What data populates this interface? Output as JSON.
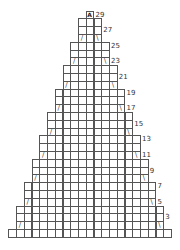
{
  "chart_title": "",
  "grid": {
    "cell_w": 7.75,
    "cell_h": 7.8,
    "origin_x": 8.3,
    "bottom_y": 229,
    "columns": 21,
    "rows": 29,
    "line_color": "#555555"
  },
  "row_labels": [
    "3",
    "5",
    "7",
    "9",
    "11",
    "13",
    "15",
    "17",
    "19",
    "21",
    "23",
    "25",
    "27",
    "29"
  ],
  "top_symbol": "A",
  "left_mark": "/",
  "right_mark": "\\",
  "bands": [
    {
      "rows": [
        1,
        1
      ],
      "cols": [
        0,
        20
      ]
    },
    {
      "rows": [
        2,
        4
      ],
      "cols": [
        1,
        19
      ],
      "mark_row": 2
    },
    {
      "rows": [
        5,
        7
      ],
      "cols": [
        2,
        18
      ],
      "mark_row": 5
    },
    {
      "rows": [
        8,
        10
      ],
      "cols": [
        3,
        17
      ],
      "mark_row": 8
    },
    {
      "rows": [
        11,
        13
      ],
      "cols": [
        4,
        16
      ],
      "mark_row": 11
    },
    {
      "rows": [
        14,
        16
      ],
      "cols": [
        5,
        15
      ],
      "mark_row": 14
    },
    {
      "rows": [
        17,
        19
      ],
      "cols": [
        6,
        14
      ],
      "mark_row": 17
    },
    {
      "rows": [
        20,
        22
      ],
      "cols": [
        7,
        13
      ],
      "mark_row": 20
    },
    {
      "rows": [
        23,
        25
      ],
      "cols": [
        8,
        12
      ],
      "mark_row": 23
    },
    {
      "rows": [
        26,
        28
      ],
      "cols": [
        9,
        11
      ],
      "mark_row": 26
    },
    {
      "rows": [
        29,
        29
      ],
      "cols": [
        10,
        10
      ],
      "symbol": "A"
    }
  ]
}
